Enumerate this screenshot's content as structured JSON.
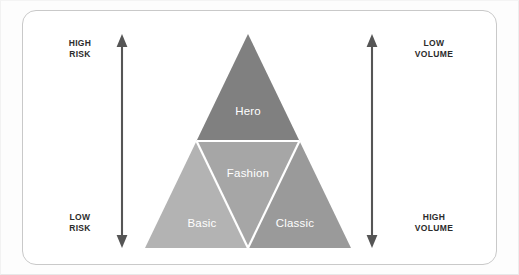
{
  "diagram": {
    "card": {
      "border_color": "#c9c9c9",
      "background": "#ffffff"
    },
    "left_axis": {
      "name": "risk-axis",
      "arrow_color": "#555555",
      "top_label": "HIGH\nRISK",
      "bottom_label": "LOW\nRISK"
    },
    "right_axis": {
      "name": "volume-axis",
      "arrow_color": "#555555",
      "top_label": "LOW\nVOLUME",
      "bottom_label": "HIGH\nVOLUME"
    },
    "pyramid": {
      "segments": [
        {
          "id": "hero",
          "label": "Hero",
          "color": "#808080",
          "position": "top"
        },
        {
          "id": "fashion",
          "label": "Fashion",
          "color": "#a6a6a6",
          "position": "bottom-center"
        },
        {
          "id": "basic",
          "label": "Basic",
          "color": "#b3b3b3",
          "position": "bottom-left"
        },
        {
          "id": "classic",
          "label": "Classic",
          "color": "#9a9a9a",
          "position": "bottom-right"
        }
      ],
      "divider_color": "#ffffff",
      "label_color": "#ffffff"
    }
  }
}
